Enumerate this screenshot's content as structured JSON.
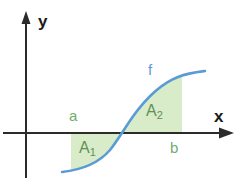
{
  "figure": {
    "axes": {
      "y_label": "y",
      "x_label": "x",
      "origin_x": 26,
      "origin_y": 133,
      "x_axis_end": 233,
      "y_axis_top": 14,
      "y_axis_bottom": 178
    },
    "curve": {
      "label": "f",
      "color": "#5b9bd5",
      "stroke_width": 2.6,
      "zero_crossing_x": 122,
      "start_point": [
        62,
        172
      ],
      "end_point": [
        205,
        72
      ],
      "path": "M 62,172 C 80,170 98,164 110,150 C 118,140 126,126 134,115 C 145,100 160,84 178,77 C 188,73 197,72 205,71"
    },
    "regions": [
      {
        "name": "A1",
        "label": "A",
        "subscript": "1",
        "fill": "#d9ecc9",
        "left_x": 71,
        "right_x": 122,
        "position": "below-axis",
        "sign": "negative"
      },
      {
        "name": "A2",
        "label": "A",
        "subscript": "2",
        "fill": "#d9ecc9",
        "left_x": 122,
        "right_x": 182,
        "position": "above-axis",
        "sign": "positive"
      }
    ],
    "bounds": {
      "lower_label": "a",
      "upper_label": "b",
      "lower_x": 71,
      "upper_x": 182,
      "color": "#6fae68"
    },
    "colors": {
      "axis": "#2b2b2b",
      "curve": "#5b9bd5",
      "region_fill": "#d9ecc9",
      "region_label": "#5f9155",
      "bound_label": "#6fae68",
      "background": "#ffffff"
    }
  }
}
